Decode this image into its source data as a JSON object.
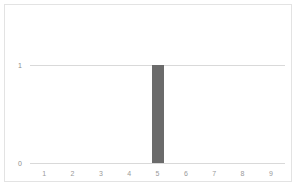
{
  "chart_data": {
    "type": "bar",
    "title": "",
    "subtitle": "",
    "xlabel": "",
    "ylabel": "",
    "categories": [
      "1",
      "2",
      "3",
      "4",
      "5",
      "6",
      "7",
      "8",
      "9"
    ],
    "values": [
      0,
      0,
      0,
      0,
      1,
      0,
      0,
      0,
      0
    ],
    "series": [
      {
        "name": "",
        "values": [
          0,
          0,
          0,
          0,
          1,
          0,
          0,
          0,
          0
        ]
      }
    ],
    "xlim": [
      0.5,
      9.5
    ],
    "ylim": [
      0,
      1
    ],
    "ytick_labels": [
      "0",
      "1"
    ],
    "ytick_values": [
      0,
      1
    ],
    "xtick_labels": [
      "1",
      "2",
      "3",
      "4",
      "5",
      "6",
      "7",
      "8",
      "9"
    ],
    "grid": "horizontal",
    "legend": "none",
    "annotations": [],
    "colors": {
      "bar": "#6b6b6b",
      "gridline": "#d9d9d9",
      "frame": "#e3e3e3",
      "background": "#ffffff",
      "tick_text": "#9a9a9a"
    }
  }
}
